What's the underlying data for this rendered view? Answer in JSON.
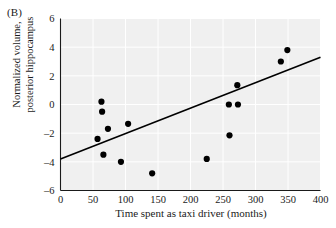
{
  "figure": {
    "panel_label": "(B)",
    "xlabel": "Time spent as taxi driver (months)",
    "ylabel_line1": "Normalized volume,",
    "ylabel_line2": "posterior hippocampus",
    "plot_bg_color": "#f0f0f0",
    "grid_color": "#ffffff",
    "axis_color": "#1a1a1a",
    "marker_color": "#000000",
    "line_color": "#000000"
  },
  "chart_data": {
    "type": "scatter",
    "title": "(B)",
    "xlabel": "Time spent as taxi driver (months)",
    "ylabel": "Normalized volume, posterior hippocampus",
    "xlim": [
      0,
      400
    ],
    "ylim": [
      -6,
      6
    ],
    "xticks": [
      0,
      50,
      100,
      150,
      200,
      250,
      300,
      350,
      400
    ],
    "yticks": [
      -6,
      -4,
      -2,
      0,
      2,
      4,
      6
    ],
    "grid": true,
    "legend": "none",
    "points": [
      {
        "x": 63,
        "y": 0.2
      },
      {
        "x": 64,
        "y": -0.5
      },
      {
        "x": 57,
        "y": -2.4
      },
      {
        "x": 73,
        "y": -1.7
      },
      {
        "x": 66,
        "y": -3.5
      },
      {
        "x": 93,
        "y": -4.0
      },
      {
        "x": 104,
        "y": -1.35
      },
      {
        "x": 141,
        "y": -4.8
      },
      {
        "x": 225,
        "y": -3.8
      },
      {
        "x": 259,
        "y": 0.0
      },
      {
        "x": 273,
        "y": 0.0
      },
      {
        "x": 260,
        "y": -2.15
      },
      {
        "x": 272,
        "y": 1.35
      },
      {
        "x": 339,
        "y": 3.0
      },
      {
        "x": 349,
        "y": 3.8
      }
    ],
    "trendline": {
      "type": "linear",
      "x_start": 0,
      "y_start": -3.8,
      "x_end": 400,
      "y_end": 3.3
    }
  }
}
